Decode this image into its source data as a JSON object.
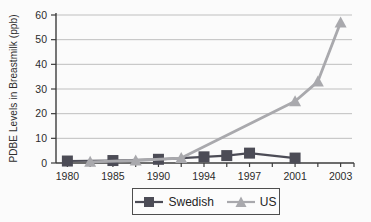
{
  "chart_data": {
    "type": "line",
    "title": "",
    "xlabel": "",
    "ylabel": "PDBE Levels in Breastmilk (ppb)",
    "ylim": [
      0,
      60
    ],
    "ytick_step": 10,
    "ytick_labels": [
      "0",
      "10",
      "20",
      "30",
      "40",
      "50",
      "60"
    ],
    "grid": true,
    "grid_color": "#bfbfbf",
    "axis_color": "#3d3d3d",
    "text_color": "#2b2b2b",
    "legend_position": "bottom-center",
    "x_slot_count": 13,
    "xticks": [
      {
        "slot": 0,
        "label": "1980"
      },
      {
        "slot": 2,
        "label": "1985"
      },
      {
        "slot": 4,
        "label": "1990"
      },
      {
        "slot": 6,
        "label": "1994"
      },
      {
        "slot": 8,
        "label": "1997"
      },
      {
        "slot": 10,
        "label": "2001"
      },
      {
        "slot": 12,
        "label": "2003"
      }
    ],
    "series": [
      {
        "name": "Swedish",
        "marker": "square",
        "color": "#4c4c56",
        "line_width": 2.2,
        "points": [
          {
            "slot": 0,
            "value": 0.8
          },
          {
            "slot": 2,
            "value": 1.0
          },
          {
            "slot": 4,
            "value": 1.5
          },
          {
            "slot": 6,
            "value": 2.5
          },
          {
            "slot": 7,
            "value": 3.0
          },
          {
            "slot": 8,
            "value": 4.0
          },
          {
            "slot": 10,
            "value": 2.0
          }
        ]
      },
      {
        "name": "US",
        "marker": "triangle",
        "color": "#a9a9ad",
        "line_width": 2.8,
        "points": [
          {
            "slot": 1,
            "value": 0.5
          },
          {
            "slot": 3,
            "value": 1.0
          },
          {
            "slot": 5,
            "value": 2.0
          },
          {
            "slot": 10,
            "value": 25.0
          },
          {
            "slot": 11,
            "value": 33.0
          },
          {
            "slot": 12,
            "value": 57.0
          }
        ]
      }
    ]
  }
}
